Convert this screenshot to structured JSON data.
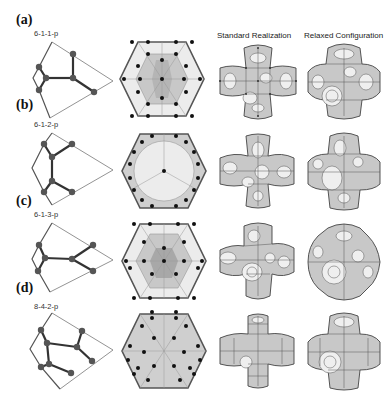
{
  "figure": {
    "column_headers": [
      "Standard Realization",
      "Relaxed Configuration"
    ],
    "rows": [
      {
        "panel": "(a)",
        "label": "6-1-1-p"
      },
      {
        "panel": "(b)",
        "label": "6-1-2-p"
      },
      {
        "panel": "(c)",
        "label": "6-1-3-p"
      },
      {
        "panel": "(d)",
        "label": "8-4-2-p"
      }
    ]
  },
  "colors": {
    "graph_edge": "#333333",
    "graph_node": "#555555",
    "hex_outline": "#555555",
    "hex_light": "#ececec",
    "hex_mid": "#cfcfcf",
    "hex_dark": "#b0b0b0",
    "hex_node": "#111111",
    "foam_cell": "#c8c8c8",
    "foam_cell_light": "#efefef",
    "foam_edge": "#444444"
  }
}
